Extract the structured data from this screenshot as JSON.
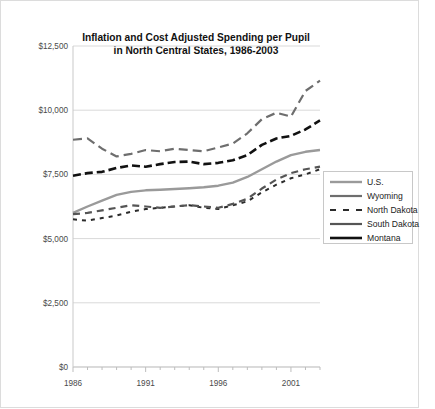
{
  "chart_data": {
    "type": "line",
    "title": "Inflation and Cost Adjusted Spending per Pupil in North Central States, 1986-2003",
    "title_line1": "Inflation and Cost Adjusted Spending per Pupil",
    "title_line2": "in North Central States, 1986-2003",
    "xlabel": "",
    "ylabel": "",
    "grid": true,
    "legend_position": "right-middle",
    "ylim": [
      0,
      12500
    ],
    "xlim": [
      1986,
      2003
    ],
    "ytick_labels": [
      "$0",
      "$2,500",
      "$5,000",
      "$7,500",
      "$10,000",
      "$12,500"
    ],
    "ytick_values": [
      0,
      2500,
      5000,
      7500,
      10000,
      12500
    ],
    "xtick_labels": [
      "1986",
      "1991",
      "1996",
      "2001"
    ],
    "xtick_values": [
      1986,
      1991,
      1996,
      2001
    ],
    "x": [
      1986,
      1987,
      1988,
      1989,
      1990,
      1991,
      1992,
      1993,
      1994,
      1995,
      1996,
      1997,
      1998,
      1999,
      2000,
      2001,
      2002,
      2003
    ],
    "series": [
      {
        "name": "U.S.",
        "color": "#9a9a9a",
        "width": 2.4,
        "dash": "none",
        "values": [
          6000,
          6250,
          6480,
          6700,
          6820,
          6880,
          6900,
          6930,
          6960,
          7000,
          7060,
          7180,
          7400,
          7700,
          8000,
          8250,
          8380,
          8450
        ]
      },
      {
        "name": "Wyoming",
        "color": "#6e6e6e",
        "width": 2.2,
        "dash": "9,5",
        "values": [
          8850,
          8900,
          8500,
          8200,
          8300,
          8450,
          8400,
          8500,
          8450,
          8400,
          8550,
          8700,
          9100,
          9650,
          9900,
          9750,
          10750,
          11150
        ]
      },
      {
        "name": "North Dakota",
        "color": "#2b2b2b",
        "width": 2.0,
        "dash": "4,5",
        "values": [
          5750,
          5700,
          5800,
          5900,
          6050,
          6150,
          6200,
          6250,
          6300,
          6200,
          6150,
          6300,
          6450,
          6800,
          7100,
          7350,
          7500,
          7700
        ]
      },
      {
        "name": "South Dakota",
        "color": "#555555",
        "width": 2.2,
        "dash": "7,5",
        "values": [
          5950,
          6000,
          6100,
          6200,
          6300,
          6250,
          6200,
          6250,
          6300,
          6250,
          6200,
          6350,
          6550,
          6950,
          7300,
          7550,
          7700,
          7800
        ]
      },
      {
        "name": "Montana",
        "color": "#111111",
        "width": 2.6,
        "dash": "8,4",
        "values": [
          7450,
          7550,
          7600,
          7750,
          7850,
          7800,
          7900,
          7980,
          8000,
          7900,
          7950,
          8050,
          8250,
          8650,
          8900,
          9000,
          9250,
          9600
        ]
      }
    ]
  },
  "legend": {
    "entries": [
      {
        "label": "U.S."
      },
      {
        "label": "Wyoming"
      },
      {
        "label": "North Dakota"
      },
      {
        "label": "South Dakota"
      },
      {
        "label": "Montana"
      }
    ]
  }
}
